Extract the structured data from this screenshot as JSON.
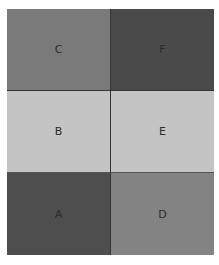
{
  "grid": {
    "columns": 2,
    "rows": 3,
    "cells": [
      {
        "label": "C",
        "row": 0,
        "col": 0,
        "color": "#7a7a7a"
      },
      {
        "label": "F",
        "row": 0,
        "col": 1,
        "color": "#4a4a4a"
      },
      {
        "label": "B",
        "row": 1,
        "col": 0,
        "color": "#c4c4c4"
      },
      {
        "label": "E",
        "row": 1,
        "col": 1,
        "color": "#c4c4c4"
      },
      {
        "label": "A",
        "row": 2,
        "col": 0,
        "color": "#4e4e4e"
      },
      {
        "label": "D",
        "row": 2,
        "col": 1,
        "color": "#838383"
      }
    ]
  }
}
